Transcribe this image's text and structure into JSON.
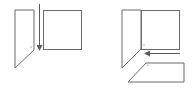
{
  "diagram": {
    "colors": {
      "background": "#ffffff",
      "line": "#6b6b6b",
      "arrow": "#5a5a5a",
      "dot": "#555555"
    },
    "step1": {
      "left_panel": {
        "points": "15,10 34,10 34,50 15,68"
      },
      "arrow": {
        "x": 39,
        "y1": 4,
        "y2": 50,
        "direction": "down"
      },
      "square": {
        "x": 43,
        "y": 10,
        "w": 38,
        "h": 39
      },
      "dot": {
        "x": 31,
        "y": 47
      }
    },
    "step2": {
      "left_panel": {
        "points": "122,10 141,10 141,49 122,68"
      },
      "square": {
        "x": 141,
        "y": 10,
        "w": 38,
        "h": 39
      },
      "arrow": {
        "y": 53,
        "x1": 180,
        "x2": 145,
        "direction": "left"
      },
      "bottom_flap": {
        "points": "146,63 184,63 184,82 128,82"
      },
      "dot_square": {
        "x": 144,
        "y": 45
      },
      "dot_flap": {
        "x": 148,
        "y": 65
      }
    }
  }
}
